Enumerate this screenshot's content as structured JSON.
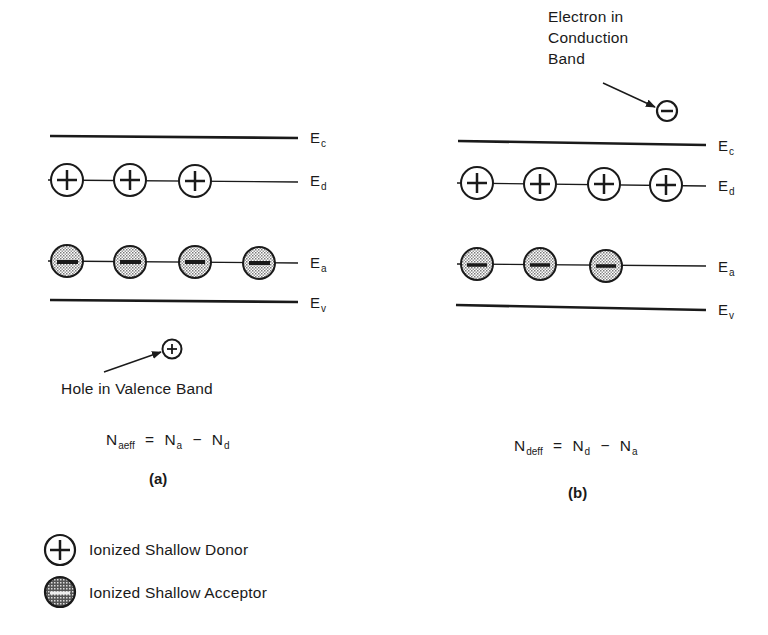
{
  "figure": {
    "panels": [
      {
        "id": "a",
        "caption": "(a)",
        "levels": {
          "Ec": {
            "label": "E",
            "sub": "c"
          },
          "Ed": {
            "label": "E",
            "sub": "d"
          },
          "Ea": {
            "label": "E",
            "sub": "a"
          },
          "Ev": {
            "label": "E",
            "sub": "v"
          }
        },
        "ionized_donors": 3,
        "ionized_acceptors": 4,
        "carrier_annotation": "Hole in Valence Band",
        "equation": {
          "lhs": "N",
          "lhs_sub": "aeff",
          "eq": "=",
          "t1": "N",
          "t1_sub": "a",
          "op": "−",
          "t2": "N",
          "t2_sub": "d"
        }
      },
      {
        "id": "b",
        "caption": "(b)",
        "levels": {
          "Ec": {
            "label": "E",
            "sub": "c"
          },
          "Ed": {
            "label": "E",
            "sub": "d"
          },
          "Ea": {
            "label": "E",
            "sub": "a"
          },
          "Ev": {
            "label": "E",
            "sub": "v"
          }
        },
        "ionized_donors": 4,
        "ionized_acceptors": 3,
        "carrier_annotation": [
          "Electron in",
          "Conduction",
          "Band"
        ],
        "equation": {
          "lhs": "N",
          "lhs_sub": "deff",
          "eq": "=",
          "t1": "N",
          "t1_sub": "d",
          "op": "−",
          "t2": "N",
          "t2_sub": "a"
        }
      }
    ],
    "legend": [
      {
        "symbol": "circle-plus-icon",
        "label": "Ionized Shallow Donor"
      },
      {
        "symbol": "stippled-circle-minus-icon",
        "label": "Ionized Shallow Acceptor"
      }
    ],
    "colors": {
      "ink": "#1a1a1a",
      "stipple": "#9a9a9a",
      "background": "#ffffff"
    }
  }
}
